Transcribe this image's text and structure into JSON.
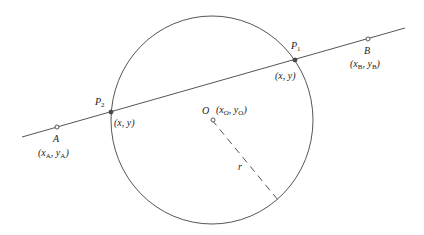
{
  "diagram": {
    "type": "line-circle-intersection",
    "colors": {
      "stroke": "#555555",
      "text": "#222222",
      "background": "#ffffff"
    },
    "circle": {
      "center_label": "O",
      "center_coords": "(xO, yO)",
      "radius_label": "r"
    },
    "line": {
      "point_a": {
        "label": "A",
        "coords_x": "x",
        "coords_x_sub": "A",
        "coords_y": "y",
        "coords_y_sub": "A"
      },
      "point_b": {
        "label": "B",
        "coords_x": "x",
        "coords_x_sub": "B",
        "coords_y": "y",
        "coords_y_sub": "B"
      }
    },
    "intersections": [
      {
        "label": "P",
        "label_sub": "1",
        "coords": "(x, y)"
      },
      {
        "label": "P",
        "label_sub": "2",
        "coords": "(x, y)"
      }
    ],
    "center": {
      "label": "O",
      "coords_x": "x",
      "coords_x_sub": "O",
      "coords_y": "y",
      "coords_y_sub": "O"
    }
  }
}
